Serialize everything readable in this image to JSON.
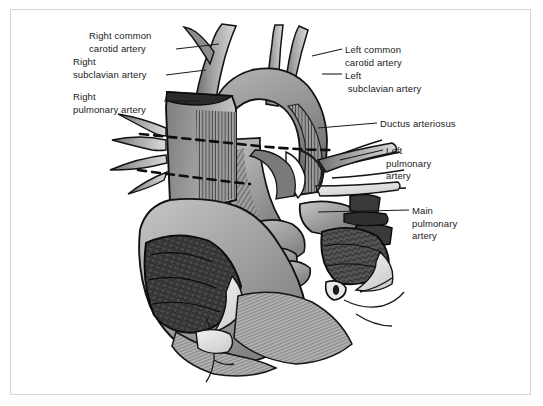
{
  "figure": {
    "type": "anatomical-illustration",
    "style": "grayscale medical line drawing with hatching",
    "border_color": "#d8d8d8",
    "background_color": "#ffffff",
    "ink_color": "#1b1b1b"
  },
  "labels": {
    "right_common_carotid_artery": "Right common\ncarotid artery",
    "right_subclavian_artery": "Right\nsubclavian artery",
    "right_pulmonary_artery": "Right\npulmonary artery",
    "left_common_carotid_artery": "Left common\ncarotid artery",
    "left_subclavian_artery": "Left\n subclavian artery",
    "ductus_arteriosus": "Ductus arteriosus",
    "left_pulmonary_artery": "Left\npulmonary\nartery",
    "main_pulmonary_artery": "Main\npulmonary\nartery"
  }
}
